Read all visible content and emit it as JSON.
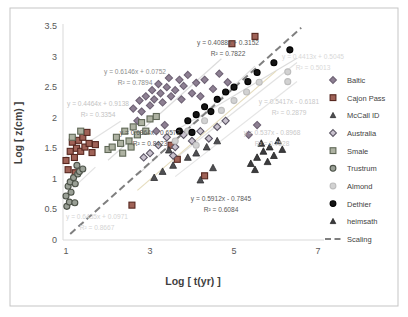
{
  "figure": {
    "border_color": "#c5c5c5",
    "background": "#ffffff"
  },
  "chart_data": {
    "type": "scatter",
    "title": "",
    "xlabel": "Log [ t(yr) ]",
    "ylabel": "Log [ z(cm) ]",
    "xlim": [
      1,
      7
    ],
    "ylim": [
      0,
      3.5
    ],
    "x_ticks": [
      "1",
      "3",
      "5",
      "7"
    ],
    "x_tick_values": [
      1,
      3,
      5,
      7
    ],
    "y_ticks": [
      "0",
      "0.5",
      "1",
      "1.5",
      "2",
      "2.5",
      "3",
      "3.5"
    ],
    "y_tick_values": [
      0,
      0.5,
      1,
      1.5,
      2,
      2.5,
      3,
      3.5
    ],
    "grid": false,
    "legend_position": "right",
    "axis_color": "#d9d9d9",
    "tick_label_color": "#595959",
    "axis_title_color": "#3f3f3f",
    "series": [
      {
        "name": "Baltic",
        "marker": "diamond",
        "fill": "#8d7f92",
        "stroke": "#6e6274",
        "points": [
          [
            2.6,
            2.15
          ],
          [
            2.7,
            1.95
          ],
          [
            2.75,
            2.28
          ],
          [
            2.8,
            2.1
          ],
          [
            2.9,
            2.35
          ],
          [
            3.0,
            2.2
          ],
          [
            3.05,
            2.45
          ],
          [
            3.1,
            2.3
          ],
          [
            3.15,
            1.78
          ],
          [
            3.2,
            2.55
          ],
          [
            3.25,
            2.4
          ],
          [
            3.3,
            2.25
          ],
          [
            3.35,
            1.88
          ],
          [
            3.4,
            2.5
          ],
          [
            3.45,
            2.65
          ],
          [
            3.5,
            2.35
          ],
          [
            3.6,
            2.45
          ],
          [
            3.7,
            2.62
          ],
          [
            3.75,
            2.3
          ],
          [
            3.8,
            2.52
          ],
          [
            3.9,
            2.7
          ],
          [
            4.0,
            2.4
          ],
          [
            4.1,
            2.57
          ],
          [
            4.2,
            2.35
          ],
          [
            4.3,
            2.62
          ],
          [
            4.5,
            2.47
          ],
          [
            4.65,
            2.72
          ],
          [
            4.85,
            2.58
          ],
          [
            5.35,
            1.72
          ],
          [
            5.55,
            1.88
          ]
        ]
      },
      {
        "name": "Cajon Pass",
        "marker": "square",
        "fill": "#9f6257",
        "stroke": "#56271f",
        "points": [
          [
            1.0,
            1.3
          ],
          [
            1.05,
            1.15
          ],
          [
            1.1,
            1.45
          ],
          [
            1.15,
            1.6
          ],
          [
            1.2,
            1.35
          ],
          [
            1.25,
            1.5
          ],
          [
            1.3,
            1.63
          ],
          [
            1.35,
            1.45
          ],
          [
            1.4,
            1.68
          ],
          [
            1.45,
            1.52
          ],
          [
            1.5,
            1.76
          ],
          [
            1.55,
            1.58
          ],
          [
            1.62,
            1.43
          ],
          [
            1.7,
            1.56
          ],
          [
            1.22,
            1.1
          ],
          [
            2.57,
            0.57
          ],
          [
            3.5,
            1.55
          ],
          [
            3.65,
            1.32
          ],
          [
            4.3,
            1.05
          ],
          [
            4.95,
            3.21
          ],
          [
            5.5,
            3.33
          ]
        ]
      },
      {
        "name": "McCall ID",
        "marker": "triangle",
        "fill": "#4f4f52",
        "stroke": "#2f2f31",
        "points": [
          [
            3.1,
            1.02
          ],
          [
            3.3,
            1.12
          ],
          [
            3.55,
            1.22
          ],
          [
            3.9,
            1.35
          ],
          [
            4.1,
            1.42
          ],
          [
            4.35,
            1.52
          ],
          [
            4.6,
            1.62
          ],
          [
            3.45,
            1.47
          ],
          [
            4.2,
            0.98
          ],
          [
            4.5,
            1.18
          ]
        ]
      },
      {
        "name": "Australia",
        "marker": "diamond",
        "fill": "#c9c2ce",
        "stroke": "#5d5766",
        "points": [
          [
            2.85,
            1.35
          ],
          [
            3.0,
            1.42
          ],
          [
            3.2,
            1.55
          ],
          [
            3.4,
            1.68
          ],
          [
            3.55,
            1.38
          ],
          [
            3.6,
            1.52
          ],
          [
            3.8,
            1.72
          ],
          [
            4.0,
            1.62
          ],
          [
            4.2,
            1.78
          ],
          [
            4.4,
            1.66
          ],
          [
            4.6,
            1.85
          ],
          [
            4.8,
            1.95
          ]
        ]
      },
      {
        "name": "Smale",
        "marker": "square",
        "fill": "#aeb2a2",
        "stroke": "#5f6756",
        "points": [
          [
            1.15,
            1.68
          ],
          [
            1.35,
            1.78
          ],
          [
            2.0,
            1.48
          ],
          [
            2.1,
            1.52
          ],
          [
            2.2,
            1.68
          ],
          [
            2.3,
            1.58
          ],
          [
            2.35,
            1.42
          ],
          [
            2.4,
            1.78
          ],
          [
            2.5,
            1.62
          ],
          [
            2.55,
            1.52
          ],
          [
            2.6,
            1.85
          ],
          [
            2.7,
            1.72
          ],
          [
            2.8,
            1.92
          ],
          [
            2.9,
            1.78
          ],
          [
            3.0,
            1.98
          ],
          [
            3.15,
            2.02
          ]
        ]
      },
      {
        "name": "Trustrum",
        "marker": "circle",
        "fill": "#9aa096",
        "stroke": "#4c5248",
        "points": [
          [
            1.0,
            0.72
          ],
          [
            1.02,
            0.55
          ],
          [
            1.05,
            0.88
          ],
          [
            1.08,
            0.62
          ],
          [
            1.1,
            0.95
          ],
          [
            1.12,
            0.78
          ],
          [
            1.18,
            1.02
          ],
          [
            1.21,
            0.61
          ],
          [
            1.22,
            0.92
          ],
          [
            1.28,
            1.08
          ],
          [
            1.32,
            1.12
          ],
          [
            1.4,
            1.16
          ],
          [
            1.26,
            1.22
          ]
        ]
      },
      {
        "name": "Almond",
        "marker": "circle",
        "fill": "#d2d2d2",
        "stroke": "#bdbdbd",
        "points": [
          [
            3.6,
            1.62
          ],
          [
            3.9,
            1.78
          ],
          [
            4.1,
            1.55
          ],
          [
            4.3,
            1.95
          ],
          [
            4.7,
            2.12
          ],
          [
            5.0,
            2.28
          ],
          [
            5.3,
            2.42
          ],
          [
            5.6,
            2.58
          ],
          [
            6.28,
            2.59
          ],
          [
            6.28,
            2.75
          ]
        ]
      },
      {
        "name": "Dethier",
        "marker": "circle",
        "fill": "#141414",
        "stroke": "#000000",
        "points": [
          [
            3.7,
            1.78
          ],
          [
            3.9,
            1.95
          ],
          [
            4.0,
            1.76
          ],
          [
            4.1,
            2.05
          ],
          [
            4.3,
            2.18
          ],
          [
            4.45,
            2.1
          ],
          [
            4.6,
            2.3
          ],
          [
            4.8,
            2.42
          ],
          [
            5.0,
            2.5
          ],
          [
            5.33,
            2.59
          ],
          [
            5.55,
            2.74
          ],
          [
            5.95,
            2.9
          ],
          [
            6.33,
            3.11
          ]
        ]
      },
      {
        "name": "heimsath",
        "marker": "triangle",
        "fill": "#3c3c3e",
        "stroke": "#222222",
        "points": [
          [
            5.4,
            1.25
          ],
          [
            5.5,
            1.15
          ],
          [
            5.55,
            1.35
          ],
          [
            5.65,
            1.58
          ],
          [
            5.7,
            1.45
          ],
          [
            5.8,
            1.28
          ],
          [
            5.85,
            1.52
          ],
          [
            5.95,
            1.38
          ],
          [
            6.05,
            1.62
          ],
          [
            6.15,
            1.48
          ]
        ]
      }
    ],
    "scaling_line": {
      "label": "Scaling",
      "color": "#7f7f7f",
      "x1": 1.1,
      "y1": 0.1,
      "x2": 6.6,
      "y2": 3.47,
      "style": "dashed"
    },
    "trendlines": [
      {
        "slope": 0.6146,
        "intercept": 0.0752,
        "t1": 2.0,
        "t2": 4.7,
        "color": "#dcdcdc"
      },
      {
        "slope": 0.4464,
        "intercept": 0.9138,
        "t1": 0.95,
        "t2": 2.3,
        "color": "#e2e2e2"
      },
      {
        "slope": 0.6364,
        "intercept": -0.6572,
        "t1": 2.7,
        "t2": 5.5,
        "color": "#dcdcdc"
      },
      {
        "slope": 0.4088,
        "intercept": 0.3152,
        "t1": 3.5,
        "t2": 6.5,
        "color": "#dcdcdc"
      },
      {
        "slope": 0.5417,
        "intercept": -0.6181,
        "t1": 3.7,
        "t2": 6.5,
        "color": "#e2e2e2"
      },
      {
        "slope": 0.537,
        "intercept": -0.8968,
        "t1": 3.6,
        "t2": 6.5,
        "color": "#e5e5e5"
      },
      {
        "slope": 0.5912,
        "intercept": -0.7845,
        "t1": 2.7,
        "t2": 6.0,
        "color": "#e6ddbe"
      },
      {
        "slope": 0.6435,
        "intercept": 0.0971,
        "t1": 0.9,
        "t2": 1.7,
        "color": "#e2e2e2"
      }
    ],
    "annotations": [
      {
        "line1": "y = 0.4088x + 0.3152",
        "line2": "R² = 0.7822",
        "x": 228,
        "y": 45,
        "color": "#595959"
      },
      {
        "line1": "y = 0.6146x + 0.0752",
        "line2": "R² = 0.7894",
        "x": 135,
        "y": 74,
        "color": "#8c8c8c"
      },
      {
        "line1": "y = 0.4464x + 0.9138",
        "line2": "R² = 0.3354",
        "x": 98,
        "y": 106,
        "color": "#c3c3c3"
      },
      {
        "line1": "y = 0.6364x - 0.6572",
        "line2": "R² = 0.8423",
        "x": 150,
        "y": 135,
        "color": "#595959"
      },
      {
        "line1": "y = 0.5417x - 0.6181",
        "line2": "R² = 0.2879",
        "x": 289,
        "y": 104,
        "color": "#c9c9c9"
      },
      {
        "line1": "y = 0.537x - 0.8968",
        "line2": "R² = 0.7528",
        "x": 272,
        "y": 135,
        "color": "#c9c9c9"
      },
      {
        "line1": "y = 0.5912x - 0.7845",
        "line2": "R² = 0.6084",
        "x": 221,
        "y": 201,
        "color": "#595959"
      },
      {
        "line1": "y = 0.6435x + 0.0971",
        "line2": "R² = 0.8667",
        "x": 97,
        "y": 219,
        "color": "#d4d4d4"
      },
      {
        "line1": "y = 0.4413x + 0.5045",
        "line2": "R² = 0.5013",
        "x": 313,
        "y": 59,
        "color": "#d8d8d8"
      }
    ],
    "legend": {
      "entries": [
        "Baltic",
        "Cajon Pass",
        "McCall ID",
        "Australia",
        "Smale",
        "Trustrum",
        "Almond",
        "Dethier",
        "heimsath",
        "Scaling"
      ],
      "text_color": "#3f3f3f"
    }
  }
}
